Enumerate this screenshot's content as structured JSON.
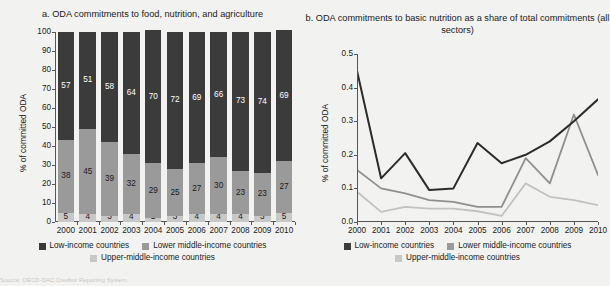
{
  "figure": {
    "source_note": "Source: OECD-DAC Creditor Reporting System."
  },
  "legend": {
    "items": [
      {
        "label": "Low-income countries",
        "color": "#3b3b3b",
        "name": "low-income"
      },
      {
        "label": "Lower middle-income countries",
        "color": "#9a9a9a",
        "name": "lower-middle-income"
      },
      {
        "label": "Upper-middle-income countries",
        "color": "#c8c8c8",
        "name": "upper-middle-income"
      }
    ]
  },
  "panel_a": {
    "title": "a.  ODA commitments to food, nutrition, and agriculture",
    "chart_data": {
      "type": "bar",
      "title": "a.  ODA commitments to food, nutrition, and agriculture",
      "xlabel": "",
      "ylabel": "% of committed ODA",
      "ylim": [
        0,
        100
      ],
      "ytick_labels": [
        "0",
        "10",
        "20",
        "30",
        "40",
        "50",
        "60",
        "70",
        "80",
        "90",
        "100"
      ],
      "grid": false,
      "stacked": true,
      "categories": [
        "2000",
        "2001",
        "2002",
        "2003",
        "2004",
        "2005",
        "2006",
        "2007",
        "2008",
        "2009",
        "2010"
      ],
      "series": [
        {
          "name": "Upper-middle-income countries",
          "color": "#c8c8c8",
          "values": [
            5,
            4,
            3,
            4,
            2,
            3,
            4,
            4,
            4,
            3,
            5
          ]
        },
        {
          "name": "Lower middle-income countries",
          "color": "#9a9a9a",
          "values": [
            38,
            45,
            39,
            32,
            29,
            25,
            27,
            30,
            23,
            23,
            27
          ]
        },
        {
          "name": "Low-income countries",
          "color": "#3b3b3b",
          "values": [
            57,
            51,
            58,
            64,
            70,
            72,
            69,
            66,
            73,
            74,
            69
          ]
        }
      ]
    }
  },
  "panel_b": {
    "title": "b.  ODA commitments to basic nutrition as a share of total commitments (all sectors)",
    "chart_data": {
      "type": "line",
      "title": "b.  ODA commitments to basic nutrition as a share of total commitments (all sectors)",
      "xlabel": "",
      "ylabel": "% of committed ODA",
      "ylim": [
        0,
        0.5
      ],
      "ytick_labels": [
        "0.0",
        "0.1",
        "0.2",
        "0.3",
        "0.4",
        "0.5"
      ],
      "grid": false,
      "x": [
        "2000",
        "2001",
        "2002",
        "2003",
        "2004",
        "2005",
        "2006",
        "2007",
        "2008",
        "2009",
        "2010"
      ],
      "series": [
        {
          "name": "Low-income countries",
          "color": "#2b2b2b",
          "values": [
            0.45,
            0.13,
            0.205,
            0.095,
            0.1,
            0.235,
            0.175,
            0.2,
            0.24,
            0.3,
            0.365
          ]
        },
        {
          "name": "Lower middle-income countries",
          "color": "#8f8f8f",
          "values": [
            0.155,
            0.1,
            0.085,
            0.065,
            0.06,
            0.045,
            0.045,
            0.19,
            0.115,
            0.32,
            0.14
          ]
        },
        {
          "name": "Upper-middle-income countries",
          "color": "#c2c2c2",
          "values": [
            0.09,
            0.03,
            0.045,
            0.04,
            0.04,
            0.032,
            0.018,
            0.115,
            0.075,
            0.065,
            0.05
          ]
        }
      ]
    }
  }
}
